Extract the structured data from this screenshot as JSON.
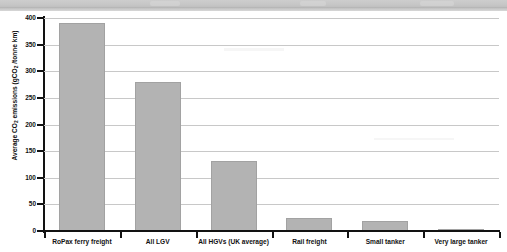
{
  "chart_data": {
    "type": "bar",
    "title": "",
    "xlabel": "",
    "ylabel": "Average CO2 emissions (gCO2 /tonne km)",
    "ylabel_parts": {
      "prefix": "Average CO",
      "sub1": "2",
      "middle": " emissions (gCO",
      "sub2": "2",
      "suffix": " /tonne km)"
    },
    "categories": [
      "RoPax ferry freight",
      "All LGV",
      "All HGVs (UK average)",
      "Rail freight",
      "Small tanker",
      "Very large tanker"
    ],
    "values": [
      390,
      280,
      132,
      25,
      19,
      2
    ],
    "ylim": [
      0,
      400
    ],
    "yticks": [
      0,
      50,
      100,
      150,
      200,
      250,
      300,
      350,
      400
    ],
    "ytick_labels": [
      "0",
      "50",
      "100",
      "150",
      "200",
      "250",
      "300",
      "350",
      "400"
    ],
    "grid": true,
    "legend": null,
    "bar_color": "#b3b3b3",
    "axis_color": "#121212",
    "grid_color": "#c8c8c8",
    "background_color": "#ffffff"
  },
  "page": {
    "banner_color": "#c6c6c6"
  }
}
